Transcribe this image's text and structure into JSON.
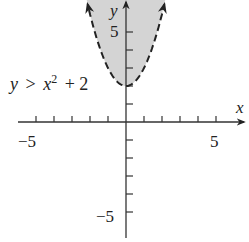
{
  "chart_data": {
    "type": "line",
    "title": "",
    "inequality": "y > x^2 + 2",
    "inequality_label": {
      "lhs": "y",
      "op": ">",
      "x": "x",
      "exp": "2",
      "rest": "+ 2"
    },
    "boundary": {
      "function": "x^2 + 2",
      "style": "dashed",
      "vertex": [
        0,
        2
      ]
    },
    "shaded_region": "above boundary (inside parabola)",
    "xlabel": "x",
    "ylabel": "y",
    "xlim": [
      -5.9,
      6.8
    ],
    "ylim": [
      -6.6,
      6.8
    ],
    "x_ticks": [
      -5,
      -4,
      -3,
      -2,
      -1,
      1,
      2,
      3,
      4,
      5
    ],
    "y_ticks": [
      -5,
      -4,
      -3,
      -2,
      -1,
      1,
      2,
      3,
      4,
      5
    ],
    "x_tick_labels": [
      "-5",
      "5"
    ],
    "y_tick_labels": [
      "5",
      "-5"
    ],
    "grid": false,
    "colors": {
      "shade": "#d4d4d4",
      "line": "#222222",
      "axis": "#333333"
    }
  },
  "labels": {
    "x_axis": "x",
    "y_axis": "y",
    "x_neg5": "−5",
    "x_pos5": "5",
    "y_pos5": "5",
    "y_neg5": "−5"
  }
}
